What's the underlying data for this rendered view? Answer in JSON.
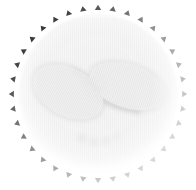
{
  "image": {
    "description": "Scalloped circular badge with faint grayscale baby feet",
    "subject": "baby-feet",
    "teeth_count": 36
  },
  "colors": {
    "background": "#ffffff",
    "teeth_dark": "#3a3a3a",
    "teeth_light": "#b8b8b8",
    "feet_fill": "#efefef",
    "feet_shadow": "#cfcfcf",
    "disc_fill": "#f7f7f7"
  }
}
